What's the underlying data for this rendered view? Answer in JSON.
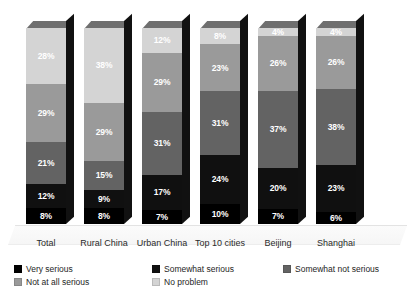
{
  "chart_data": {
    "type": "bar",
    "subtype": "stacked-100-percent-3d",
    "title": "",
    "subtitle": "",
    "xlabel": "",
    "ylabel": "",
    "ylim": [
      0,
      100
    ],
    "grid": false,
    "legend_position": "bottom",
    "value_suffix": "%",
    "categories": [
      "Total",
      "Rural China",
      "Urban China",
      "Top 10 cities",
      "Beijing",
      "Shanghai"
    ],
    "series": [
      {
        "name": "Very serious",
        "color": "#000000",
        "values": [
          8,
          8,
          7,
          10,
          7,
          6
        ]
      },
      {
        "name": "Somewhat serious",
        "color": "#101010",
        "values": [
          12,
          9,
          17,
          24,
          20,
          23
        ]
      },
      {
        "name": "Somewhat not serious",
        "color": "#636363",
        "values": [
          21,
          15,
          31,
          31,
          37,
          38
        ]
      },
      {
        "name": "Not at all serious",
        "color": "#9a9a9a",
        "values": [
          29,
          29,
          29,
          23,
          26,
          26
        ]
      },
      {
        "name": "No problem",
        "color": "#d4d4d4",
        "values": [
          28,
          38,
          12,
          8,
          4,
          4
        ]
      }
    ]
  },
  "legend": {
    "items": [
      {
        "label": "Very serious",
        "color": "#000000"
      },
      {
        "label": "Somewhat serious",
        "color": "#101010"
      },
      {
        "label": "Somewhat not serious",
        "color": "#636363"
      },
      {
        "label": "Not at all serious",
        "color": "#9a9a9a"
      },
      {
        "label": "No problem",
        "color": "#d4d4d4"
      }
    ]
  },
  "axis": {
    "categories": [
      "Total",
      "Rural China",
      "Urban China",
      "Top 10 cities",
      "Beijing",
      "Shanghai"
    ]
  },
  "labels": {
    "bars": [
      {
        "category": "Total",
        "segments": [
          "28%",
          "29%",
          "21%",
          "12%",
          "8%"
        ]
      },
      {
        "category": "Rural China",
        "segments": [
          "38%",
          "29%",
          "15%",
          "9%",
          "8%"
        ]
      },
      {
        "category": "Urban China",
        "segments": [
          "12%",
          "29%",
          "31%",
          "17%",
          "7%"
        ]
      },
      {
        "category": "Top 10 cities",
        "segments": [
          "8%",
          "23%",
          "31%",
          "24%",
          "10%"
        ]
      },
      {
        "category": "Beijing",
        "segments": [
          "4%",
          "26%",
          "37%",
          "20%",
          "7%"
        ]
      },
      {
        "category": "Shanghai",
        "segments": [
          "4%",
          "26%",
          "38%",
          "23%",
          "6%"
        ]
      }
    ]
  }
}
